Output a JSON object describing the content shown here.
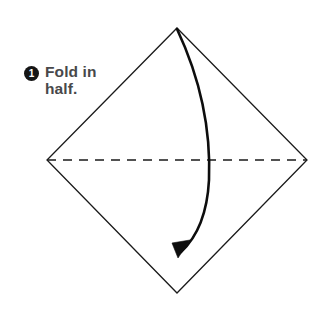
{
  "figure": {
    "width": 330,
    "height": 317,
    "background_color": "#ffffff"
  },
  "step": {
    "number": "1",
    "badge_color": "#151515",
    "badge_text_color": "#ffffff",
    "instruction_line_1": "Fold in",
    "instruction_line_2": "half.",
    "instruction_full": "Fold in\nhalf.",
    "text_color": "#48484a"
  },
  "shapes": {
    "paper": {
      "name": "square-paper-diamond",
      "outline_color": "#1a1a1a",
      "outline_width": 1.3,
      "fill": "#ffffff",
      "vertices": {
        "top": {
          "x": 177,
          "y": 28
        },
        "right": {
          "x": 307,
          "y": 160
        },
        "bottom": {
          "x": 177,
          "y": 293
        },
        "left": {
          "x": 47,
          "y": 160
        }
      },
      "points_path": "177,28 307,160 177,293 47,160"
    },
    "fold_line": {
      "name": "horizontal-fold-crease",
      "style": "dashed",
      "color": "#1a1a1a",
      "width": 1.6,
      "dash_pattern": "9 7",
      "from": {
        "x": 47,
        "y": 160
      },
      "to": {
        "x": 307,
        "y": 160
      }
    },
    "fold_arrow": {
      "name": "fold-direction-arrow",
      "color": "#0d0d0d",
      "width": 2.6,
      "path": "M 177 29 C 200 78 211 130 209 180 C 207 218 194 240 181 252",
      "start": {
        "x": 177,
        "y": 29
      },
      "end": {
        "x": 181,
        "y": 252
      },
      "max_bow_x": 210,
      "arrowhead": {
        "points": "178,258 190,240 172,243",
        "tip": {
          "x": 178,
          "y": 258
        }
      }
    }
  }
}
